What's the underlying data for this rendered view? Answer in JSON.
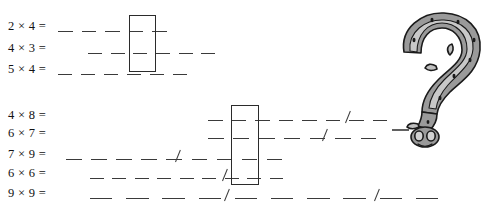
{
  "worksheet": {
    "title": "Multiplication practice worksheet",
    "ink_color": "#3a3a3a",
    "box_color": "#2b2b2b",
    "groups": [
      {
        "name": "upper-group",
        "rows": [
          {
            "equation": "2 × 4 =",
            "dash_count": 5,
            "dash_start_x": 58,
            "dash_end_x": 176,
            "slashes": []
          },
          {
            "equation": "4 × 3 =",
            "dash_count": 6,
            "dash_start_x": 88,
            "dash_end_x": 224,
            "slashes": []
          },
          {
            "equation": "5 × 4 =",
            "dash_count": 6,
            "dash_start_x": 58,
            "dash_end_x": 196,
            "slashes": []
          }
        ],
        "box": {
          "x": 129,
          "y": 15,
          "w": 27,
          "h": 57
        }
      },
      {
        "name": "lower-group",
        "rows": [
          {
            "equation": "4 × 8 =",
            "dash_count": 8,
            "dash_start_x": 208,
            "dash_end_x": 396,
            "slashes": [
              345
            ]
          },
          {
            "equation": "6 × 7 =",
            "dash_count": 7,
            "dash_start_x": 208,
            "dash_end_x": 386,
            "slashes": [
              322
            ]
          },
          {
            "equation": "7 × 9 =",
            "dash_count": 9,
            "dash_start_x": 66,
            "dash_end_x": 292,
            "slashes": [
              175
            ]
          },
          {
            "equation": "6 × 6 =",
            "dash_count": 9,
            "dash_start_x": 90,
            "dash_end_x": 292,
            "slashes": [
              222
            ]
          },
          {
            "equation": "9 × 9 =",
            "dash_count": 10,
            "dash_start_x": 90,
            "dash_end_x": 452,
            "slashes": [
              224,
              374
            ]
          }
        ],
        "box": {
          "x": 231,
          "y": 105,
          "w": 28,
          "h": 80
        }
      }
    ],
    "illustration": {
      "name": "question-mark-creature",
      "description": "Hand-drawn grey question mark shaped like a coiled snake with a head at the dot",
      "fill_color": "#9a9a9a",
      "highlight_color": "#c9c9c9",
      "outline_color": "#1a1a1a"
    }
  }
}
